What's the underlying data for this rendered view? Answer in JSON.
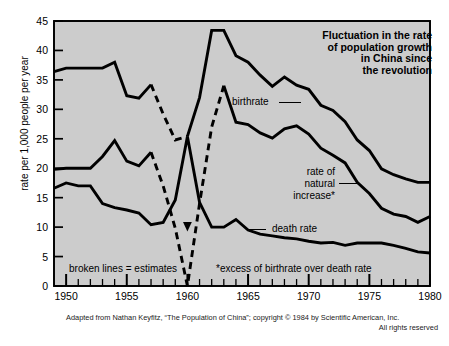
{
  "title": {
    "line1": "Fluctuation in the rate",
    "line2": "of population growth",
    "line3": "in China since",
    "line4": "the revolution"
  },
  "axes": {
    "ylabel": "rate per 1,000 people per year",
    "yticks": [
      "0",
      "5",
      "10",
      "15",
      "20",
      "25",
      "30",
      "35",
      "40",
      "45"
    ],
    "xticks": [
      "1950",
      "1955",
      "1960",
      "1965",
      "1970",
      "1975",
      "1980"
    ]
  },
  "annotations": {
    "birthrate": "birthrate",
    "natural_increase_l1": "rate of",
    "natural_increase_l2": "natural",
    "natural_increase_l3": "increase*",
    "death_rate": "death rate"
  },
  "notes": {
    "estimates": "broken lines = estimates",
    "footnote": "*excess of birthrate over death rate"
  },
  "credit": {
    "line1": "Adapted from Nathan Keyfitz, “The Population of China”; copyright © 1984 by Scientific American, Inc.",
    "line2": "All rights reserved"
  },
  "colors": {
    "plot_background": "#cccccc",
    "line": "#000000",
    "page_background": "#ffffff"
  },
  "chart_data": {
    "type": "line",
    "title": "Fluctuation in the rate of population growth in China since the revolution",
    "xlabel": "",
    "ylabel": "rate per 1,000 people per year",
    "xlim": [
      1949,
      1980
    ],
    "ylim": [
      0,
      45
    ],
    "grid": false,
    "legend": "inline-annotations",
    "series": [
      {
        "name": "birthrate",
        "style": "solid-with-dashed-estimates",
        "x": [
          1949,
          1950,
          1951,
          1952,
          1953,
          1954,
          1955,
          1956,
          1957,
          1958,
          1959,
          1960,
          1961,
          1962,
          1963,
          1964,
          1965,
          1966,
          1967,
          1968,
          1969,
          1970,
          1971,
          1972,
          1973,
          1974,
          1975,
          1976,
          1977,
          1978,
          1979,
          1980
        ],
        "values": [
          36.4,
          37.0,
          37.0,
          37.0,
          37.0,
          38.0,
          32.3,
          31.9,
          34.2,
          29.2,
          24.8,
          25.4,
          32.0,
          43.4,
          43.4,
          39.1,
          38.0,
          35.8,
          33.9,
          35.5,
          34.1,
          33.4,
          30.7,
          29.8,
          27.9,
          24.8,
          23.0,
          19.9,
          18.9,
          18.2,
          17.6,
          17.6
        ],
        "dashed_segments": [
          [
            1957,
            1960
          ]
        ]
      },
      {
        "name": "rate of natural increase",
        "style": "solid-with-dashed-estimates",
        "x": [
          1949,
          1950,
          1951,
          1952,
          1953,
          1954,
          1955,
          1956,
          1957,
          1958,
          1959,
          1960,
          1961,
          1962,
          1963,
          1964,
          1965,
          1966,
          1967,
          1968,
          1969,
          1970,
          1971,
          1972,
          1973,
          1974,
          1975,
          1976,
          1977,
          1978,
          1979,
          1980
        ],
        "values": [
          19.8,
          20.0,
          20.0,
          20.0,
          22.0,
          24.7,
          21.2,
          20.4,
          22.7,
          17.0,
          9.8,
          -4.5,
          14.0,
          27.0,
          34.0,
          27.8,
          27.4,
          26.0,
          25.1,
          26.7,
          27.2,
          25.8,
          23.4,
          22.2,
          20.9,
          17.6,
          15.7,
          13.2,
          12.2,
          11.8,
          10.8,
          11.8
        ],
        "dashed_segments": [
          [
            1957,
            1960
          ],
          [
            1960,
            1963
          ]
        ]
      },
      {
        "name": "death rate",
        "style": "solid",
        "x": [
          1949,
          1950,
          1951,
          1952,
          1953,
          1954,
          1955,
          1956,
          1957,
          1958,
          1959,
          1960,
          1961,
          1962,
          1963,
          1964,
          1965,
          1966,
          1967,
          1968,
          1969,
          1970,
          1971,
          1972,
          1973,
          1974,
          1975,
          1976,
          1977,
          1978,
          1979,
          1980
        ],
        "values": [
          16.6,
          17.5,
          17.0,
          17.0,
          14.0,
          13.3,
          12.9,
          12.4,
          10.4,
          10.8,
          14.6,
          25.4,
          14.2,
          10.0,
          10.0,
          11.3,
          9.5,
          8.8,
          8.5,
          8.2,
          8.0,
          7.6,
          7.3,
          7.4,
          6.9,
          7.3,
          7.3,
          7.3,
          6.9,
          6.4,
          5.8,
          5.6
        ]
      }
    ],
    "notes": [
      "broken lines = estimates",
      "*excess of birthrate over death rate"
    ]
  }
}
